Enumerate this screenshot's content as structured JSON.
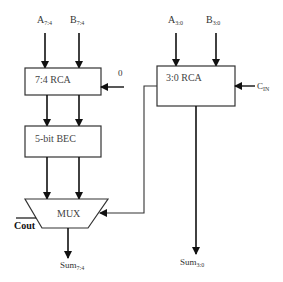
{
  "diagram": {
    "type": "carry-select adder block diagram",
    "inputs": {
      "a_high": {
        "base": "A",
        "sub": "7:4"
      },
      "b_high": {
        "base": "B",
        "sub": "7:4"
      },
      "a_low": {
        "base": "A",
        "sub": "3:0"
      },
      "b_low": {
        "base": "B",
        "sub": "3:0"
      },
      "carry_zero": "0",
      "cin": {
        "base": "C",
        "sub": "IN"
      }
    },
    "blocks": {
      "rca_high": "7:4 RCA",
      "bec": "5-bit BEC",
      "mux": "MUX",
      "rca_low": "3:0 RCA"
    },
    "outputs": {
      "cout": "Cout",
      "sum_high": {
        "base": "Sum",
        "sub": "7:4"
      },
      "sum_low": {
        "base": "Sum",
        "sub": "3:0"
      }
    },
    "colors": {
      "line": "#222222",
      "box_stroke": "#333333",
      "background": "#ffffff"
    }
  }
}
